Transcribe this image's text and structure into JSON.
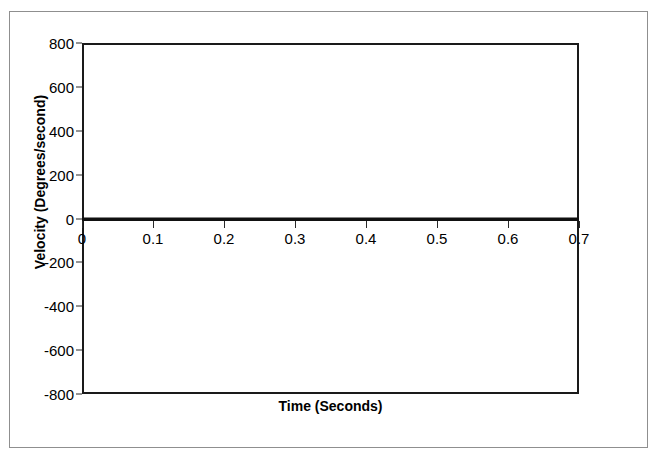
{
  "figure": {
    "top_clipped_text": "Incidence",
    "frame_color": "#8f8f8f",
    "plot_border_color": "#1a1a1a",
    "background": "#ffffff"
  },
  "chart_data": {
    "type": "line",
    "title": "",
    "subtitle": "",
    "xlabel": "Time (Seconds)",
    "ylabel": "Velocity (Degrees/second)",
    "xlim": [
      0,
      0.7
    ],
    "ylim": [
      -800,
      800
    ],
    "grid": false,
    "legend": false,
    "x_ticks": [
      "0",
      "0.1",
      "0.2",
      "0.3",
      "0.4",
      "0.5",
      "0.6",
      "0.7"
    ],
    "x_tick_values": [
      0,
      0.1,
      0.2,
      0.3,
      0.4,
      0.5,
      0.6,
      0.7
    ],
    "y_ticks": [
      "800",
      "600",
      "400",
      "200",
      "0",
      "-200",
      "-400",
      "-600",
      "-800"
    ],
    "y_tick_values": [
      800,
      600,
      400,
      200,
      0,
      -200,
      -400,
      -600,
      -800
    ],
    "series": [
      {
        "name": "Velocity",
        "color": "#111111",
        "x": [
          0,
          0.1,
          0.2,
          0.3,
          0.4,
          0.5,
          0.6,
          0.7
        ],
        "values": [
          0,
          0,
          0,
          0,
          0,
          0,
          0,
          0
        ]
      }
    ]
  }
}
